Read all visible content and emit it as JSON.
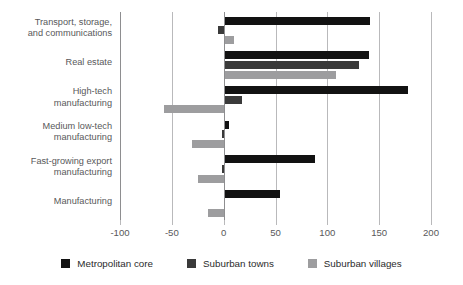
{
  "chart_data": {
    "type": "bar",
    "orientation": "horizontal",
    "title": "",
    "subtitle": "",
    "xlabel": "",
    "ylabel": "",
    "xlim": [
      -100,
      200
    ],
    "xticks": [
      -100,
      -50,
      0,
      50,
      100,
      150,
      200
    ],
    "xtick_labels": [
      "-100",
      "-50",
      "0",
      "50",
      "100",
      "150",
      "200"
    ],
    "grid": true,
    "legend_position": "bottom",
    "categories": [
      "Transport, storage,\nand communications",
      "Real estate",
      "High-tech\nmanufacturing",
      "Medium low-tech\nmanufacturing",
      "Fast-growing export\nmanufacturing",
      "Manufacturing"
    ],
    "series": [
      {
        "name": "Metropolitan core",
        "color": "#121212",
        "values": [
          141,
          140,
          178,
          5,
          88,
          54
        ]
      },
      {
        "name": "Suburban towns",
        "color": "#3a3a3a",
        "values": [
          -5,
          131,
          18,
          -2,
          -2,
          0
        ]
      },
      {
        "name": "Suburban villages",
        "color": "#9d9d9f",
        "values": [
          10,
          108,
          -58,
          -31,
          -25,
          -15
        ]
      }
    ]
  },
  "legend": {
    "items": [
      {
        "label": "Metropolitan core",
        "swatch": "metro"
      },
      {
        "label": "Suburban towns",
        "swatch": "towns"
      },
      {
        "label": "Suburban villages",
        "swatch": "villages"
      }
    ]
  },
  "colors": {
    "metropolitan_core": "#121212",
    "suburban_towns": "#3a3a3a",
    "suburban_villages": "#9d9d9f",
    "gridline": "#b9b9bb",
    "axis": "#8e8e90",
    "text": "#58585a"
  }
}
